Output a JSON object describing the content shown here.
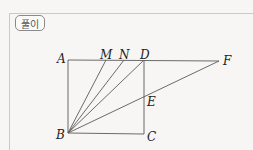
{
  "header": {
    "badge_label": "풀이"
  },
  "diagram": {
    "points": {
      "A": {
        "label": "A",
        "x": 68,
        "y": 60
      },
      "M": {
        "label": "M",
        "x": 106,
        "y": 60
      },
      "N": {
        "label": "N",
        "x": 124,
        "y": 60
      },
      "D": {
        "label": "D",
        "x": 144,
        "y": 60
      },
      "F": {
        "label": "F",
        "x": 219,
        "y": 61
      },
      "E": {
        "label": "E",
        "x": 144,
        "y": 97
      },
      "B": {
        "label": "B",
        "x": 68,
        "y": 133
      },
      "C": {
        "label": "C",
        "x": 144,
        "y": 134
      }
    },
    "segments": [
      "AD",
      "DF",
      "AB",
      "BC",
      "DC",
      "BM",
      "BN",
      "BD",
      "BF"
    ],
    "line_color": "#555555"
  }
}
